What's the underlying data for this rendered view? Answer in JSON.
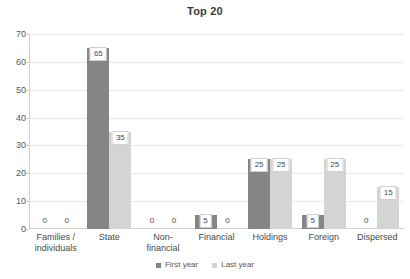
{
  "chart_data": {
    "type": "bar",
    "title": "Top 20",
    "xlabel": "",
    "ylabel": "",
    "ylim": [
      0,
      70
    ],
    "ytick_step": 10,
    "yticks": [
      0,
      10,
      20,
      30,
      40,
      50,
      60,
      70
    ],
    "ytick_labels": [
      "0",
      "10",
      "20",
      "30",
      "40",
      "50",
      "60",
      "70"
    ],
    "grid": true,
    "legend_position": "bottom",
    "categories": [
      "Families / individuals",
      "State",
      "Non-financial",
      "Financial",
      "Holdings",
      "Foreign",
      "Dispersed"
    ],
    "category_lines": [
      [
        "Families /",
        "individuals"
      ],
      [
        "State"
      ],
      [
        "Non-financial"
      ],
      [
        "Financial"
      ],
      [
        "Holdings"
      ],
      [
        "Foreign"
      ],
      [
        "Dispersed"
      ]
    ],
    "series": [
      {
        "name": "First year",
        "color": "#858585",
        "values": [
          0,
          65,
          0,
          5,
          25,
          5,
          0
        ],
        "labels": [
          "0",
          "65",
          "0",
          "5",
          "25",
          "5",
          "0"
        ]
      },
      {
        "name": "Last year",
        "color": "#d4d4d4",
        "values": [
          0,
          35,
          0,
          0,
          25,
          25,
          15
        ],
        "labels": [
          "0",
          "35",
          "0",
          "0",
          "25",
          "25",
          "15"
        ]
      }
    ]
  },
  "legend": {
    "items": [
      {
        "label": "First year",
        "swatch": "first"
      },
      {
        "label": "Last year",
        "swatch": "last"
      }
    ]
  },
  "colors": {
    "first_year": "#858585",
    "last_year": "#d4d4d4",
    "gridline": "#e8e8e8",
    "axis": "#d0d0d0",
    "text": "#4a4a4a",
    "background": "#ffffff"
  }
}
